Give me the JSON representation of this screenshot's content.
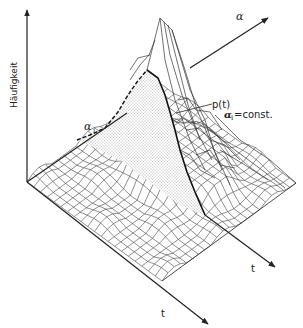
{
  "diagram": {
    "type": "3d-surface-plot",
    "axes": {
      "vertical": {
        "label": "Häufigkeit"
      },
      "depth": {
        "label": "α"
      },
      "time_front": {
        "label": "t"
      },
      "time_back": {
        "label": "t"
      }
    },
    "annotations": {
      "alpha_i": {
        "label": "α",
        "subscript": "i"
      },
      "curve": {
        "label": "p(t)",
        "condition_symbol": "α",
        "condition_subscript": "i",
        "condition_text": " =const."
      }
    },
    "colors": {
      "ink": "#222222",
      "grid": "#444444",
      "stipple": "#555555",
      "background": "#ffffff"
    }
  }
}
